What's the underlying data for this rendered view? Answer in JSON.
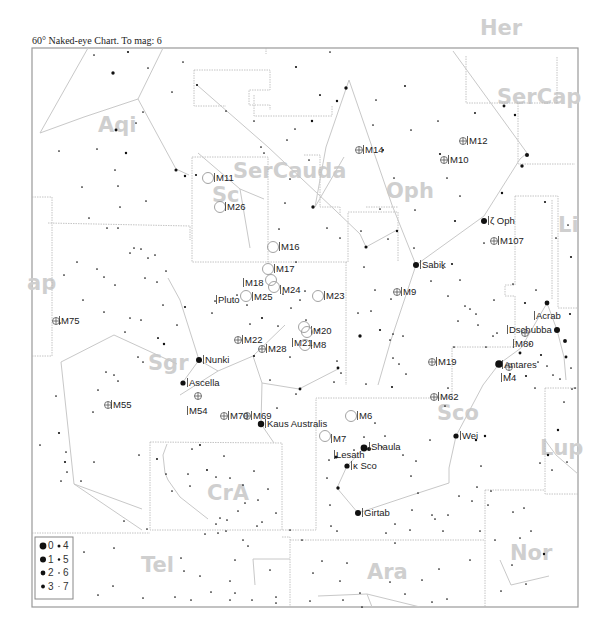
{
  "title": "60° Naked-eye Chart. To mag: 6",
  "frame": {
    "x": 32,
    "y": 48,
    "w": 546,
    "h": 559
  },
  "colors": {
    "star": "#111111",
    "constellation_label": "#cfcfcf",
    "boundary": "#b5b5b5",
    "stick_line": "#c8c8c8"
  },
  "constellations": [
    {
      "name": "Aqi",
      "x": 98,
      "y": 132
    },
    {
      "name": "SerCauda",
      "x": 233,
      "y": 178
    },
    {
      "name": "Oph",
      "x": 386,
      "y": 198
    },
    {
      "name": "Her",
      "x": 480,
      "y": 35
    },
    {
      "name": "SerCap",
      "x": 497,
      "y": 104
    },
    {
      "name": "Li",
      "x": 558,
      "y": 232
    },
    {
      "name": "ap",
      "x": 27,
      "y": 290
    },
    {
      "name": "Sgr",
      "x": 148,
      "y": 370
    },
    {
      "name": "Sco",
      "x": 437,
      "y": 420
    },
    {
      "name": "Lup",
      "x": 540,
      "y": 455
    },
    {
      "name": "CrA",
      "x": 207,
      "y": 500
    },
    {
      "name": "Tel",
      "x": 141,
      "y": 572
    },
    {
      "name": "Ara",
      "x": 367,
      "y": 579
    },
    {
      "name": "Nor",
      "x": 510,
      "y": 560
    },
    {
      "name": "Sc",
      "x": 212,
      "y": 202
    }
  ],
  "named_stars": [
    {
      "name": "Sabik",
      "x": 416,
      "y": 265,
      "r": 3
    },
    {
      "name": "ζ Oph",
      "x": 484,
      "y": 221,
      "r": 3
    },
    {
      "name": "Nunki",
      "x": 199,
      "y": 360,
      "r": 3
    },
    {
      "name": "Ascella",
      "x": 183,
      "y": 383,
      "r": 2.6
    },
    {
      "name": "Kaus Australis",
      "x": 261,
      "y": 424,
      "r": 3.2
    },
    {
      "name": "Shaula",
      "x": 364,
      "y": 448,
      "r": 3.4
    },
    {
      "name": "Lesath",
      "x": 369,
      "y": 449,
      "r": 2
    },
    {
      "name": "κ Sco",
      "x": 347,
      "y": 466,
      "r": 2.6
    },
    {
      "name": "Girtab",
      "x": 358,
      "y": 513,
      "r": 3
    },
    {
      "name": "Wei",
      "x": 456,
      "y": 436,
      "r": 2.6
    },
    {
      "name": "Antares",
      "x": 499,
      "y": 364,
      "r": 3.8
    },
    {
      "name": "Dschubba",
      "x": 557,
      "y": 330,
      "r": 3
    },
    {
      "name": "Acrab",
      "x": 547,
      "y": 303,
      "r": 2.4
    }
  ],
  "star_labels": [
    {
      "text": "Sabik",
      "x": 422,
      "y": 268
    },
    {
      "text": "ζ Oph",
      "x": 490,
      "y": 224
    },
    {
      "text": "Nunki",
      "x": 205,
      "y": 363
    },
    {
      "text": "Ascella",
      "x": 189,
      "y": 386
    },
    {
      "text": "Kaus Australis",
      "x": 267,
      "y": 427
    },
    {
      "text": "Shaula",
      "x": 371,
      "y": 450
    },
    {
      "text": "Lesath",
      "x": 336,
      "y": 458
    },
    {
      "text": "κ Sco",
      "x": 353,
      "y": 469
    },
    {
      "text": "Girtab",
      "x": 364,
      "y": 516
    },
    {
      "text": "Wei",
      "x": 462,
      "y": 439
    },
    {
      "text": "Antares",
      "x": 504,
      "y": 368
    },
    {
      "text": "Dschubba",
      "x": 509,
      "y": 333
    },
    {
      "text": "Acrab",
      "x": 536,
      "y": 319
    },
    {
      "text": "Pluto",
      "x": 218,
      "y": 303
    }
  ],
  "deep_sky": [
    {
      "name": "M11",
      "type": "oc",
      "x": 208,
      "y": 178,
      "lx": 216,
      "ly": 181
    },
    {
      "name": "M26",
      "type": "oc",
      "x": 220,
      "y": 207,
      "lx": 227,
      "ly": 210
    },
    {
      "name": "M16",
      "type": "oc",
      "x": 273,
      "y": 247,
      "lx": 281,
      "ly": 250
    },
    {
      "name": "M17",
      "type": "oc",
      "x": 268,
      "y": 269,
      "lx": 276,
      "ly": 272
    },
    {
      "name": "M18",
      "type": "oc",
      "x": 271,
      "y": 280,
      "lx": 245,
      "ly": 286
    },
    {
      "name": "M24",
      "type": "oc",
      "x": 274,
      "y": 287,
      "lx": 282,
      "ly": 293
    },
    {
      "name": "M25",
      "type": "oc",
      "x": 246,
      "y": 296,
      "lx": 254,
      "ly": 300
    },
    {
      "name": "M23",
      "type": "oc",
      "x": 318,
      "y": 296,
      "lx": 326,
      "ly": 299
    },
    {
      "name": "M20",
      "type": "oc",
      "x": 304,
      "y": 327,
      "lx": 313,
      "ly": 334
    },
    {
      "name": "M21",
      "type": "oc",
      "x": 307,
      "y": 332,
      "lx": 294,
      "ly": 346
    },
    {
      "name": "M8",
      "type": "oc",
      "x": 305,
      "y": 345,
      "lx": 313,
      "ly": 348
    },
    {
      "name": "M6",
      "type": "oc",
      "x": 351,
      "y": 416,
      "lx": 359,
      "ly": 419
    },
    {
      "name": "M7",
      "type": "oc",
      "x": 325,
      "y": 436,
      "lx": 333,
      "ly": 442
    },
    {
      "name": "M14",
      "type": "gc",
      "x": 359,
      "y": 150,
      "lx": 365,
      "ly": 153
    },
    {
      "name": "M12",
      "type": "gc",
      "x": 463,
      "y": 141,
      "lx": 469,
      "ly": 144
    },
    {
      "name": "M10",
      "type": "gc",
      "x": 444,
      "y": 160,
      "lx": 450,
      "ly": 163
    },
    {
      "name": "M107",
      "type": "gc",
      "x": 494,
      "y": 241,
      "lx": 500,
      "ly": 244
    },
    {
      "name": "M9",
      "type": "gc",
      "x": 397,
      "y": 292,
      "lx": 403,
      "ly": 295
    },
    {
      "name": "M19",
      "type": "gc",
      "x": 432,
      "y": 362,
      "lx": 438,
      "ly": 365
    },
    {
      "name": "M62",
      "type": "gc",
      "x": 434,
      "y": 397,
      "lx": 440,
      "ly": 400
    },
    {
      "name": "M22",
      "type": "gc",
      "x": 238,
      "y": 340,
      "lx": 244,
      "ly": 343
    },
    {
      "name": "M28",
      "type": "gc",
      "x": 262,
      "y": 349,
      "lx": 268,
      "ly": 352
    },
    {
      "name": "M75",
      "type": "gc",
      "x": 56,
      "y": 321,
      "lx": 61,
      "ly": 324
    },
    {
      "name": "M55",
      "type": "gc",
      "x": 108,
      "y": 405,
      "lx": 113,
      "ly": 408
    },
    {
      "name": "M54",
      "type": "gc",
      "x": 198,
      "y": 396,
      "lx": 189,
      "ly": 414
    },
    {
      "name": "M70",
      "type": "gc",
      "x": 224,
      "y": 416,
      "lx": 230,
      "ly": 419
    },
    {
      "name": "M69",
      "type": "gc",
      "x": 247,
      "y": 416,
      "lx": 253,
      "ly": 419
    },
    {
      "name": "M80",
      "type": "gc",
      "x": 525,
      "y": 333,
      "lx": 515,
      "ly": 347
    },
    {
      "name": "M4",
      "type": "gc",
      "x": 509,
      "y": 367,
      "lx": 503,
      "ly": 381
    }
  ],
  "legend": {
    "rows": [
      {
        "big": "0",
        "small": "4"
      },
      {
        "big": "1",
        "small": "5"
      },
      {
        "big": "2",
        "small": "6"
      },
      {
        "big": "3",
        "small": "7"
      }
    ]
  }
}
